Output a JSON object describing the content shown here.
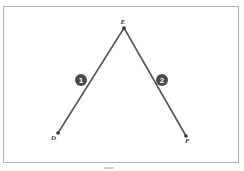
{
  "diagram": {
    "points": [
      {
        "label": "E",
        "x": 124,
        "y": 28
      },
      {
        "label": "D",
        "x": 58,
        "y": 133
      },
      {
        "label": "F",
        "x": 186,
        "y": 136
      }
    ],
    "segments": [
      {
        "from": "E",
        "to": "D",
        "marker": "1"
      },
      {
        "from": "E",
        "to": "F",
        "marker": "2"
      }
    ],
    "markers": [
      {
        "label": "1",
        "x": 81,
        "y": 80
      },
      {
        "label": "2",
        "x": 162,
        "y": 80
      }
    ],
    "colors": {
      "line": "#555555",
      "marker_fill": "#4a4a4a",
      "marker_text": "#ffffff",
      "frame": "#b4b4b4"
    }
  }
}
